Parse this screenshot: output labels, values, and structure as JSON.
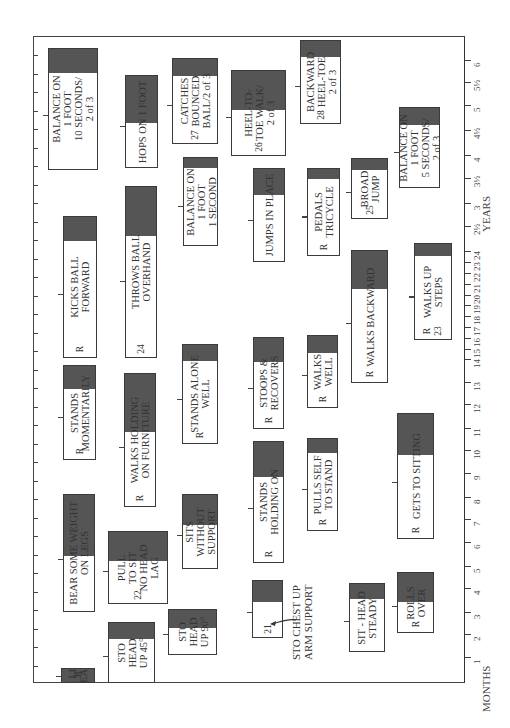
{
  "chart_data": {
    "type": "table",
    "orientation": "rotated 90deg counter-clockwise; age axis runs along right edge from bottom (1 month) to top (6 years)",
    "axes": {
      "months_label": "MONTHS",
      "years_label": "YEARS",
      "ticks": [
        "1",
        "2",
        "3",
        "4",
        "5",
        "6",
        "7",
        "8",
        "9",
        "10",
        "11",
        "12",
        "13",
        "14",
        "15",
        "16",
        "17",
        "18",
        "19",
        "20",
        "21",
        "22",
        "23",
        "24",
        "2½",
        "3",
        "3½",
        "4",
        "4½",
        "5",
        "5½",
        "6"
      ]
    },
    "milestones": [
      {
        "id": "balance10",
        "lines": [
          "BALANCE ON",
          "1 FOOT",
          "10 SECONDS/",
          "2 of 3"
        ],
        "prefix": "",
        "number": ""
      },
      {
        "id": "kicks",
        "lines": [
          "KICKS BALL",
          "FORWARD"
        ],
        "prefix": "R",
        "number": ""
      },
      {
        "id": "standsmom",
        "lines": [
          "STANDS",
          "MOMENTARILY"
        ],
        "prefix": "R",
        "number": ""
      },
      {
        "id": "bearweight",
        "lines": [
          "BEAR SOME WEIGHT",
          "ON LEGS"
        ],
        "prefix": "",
        "number": ""
      },
      {
        "id": "stolifts",
        "lines": [
          "STO LIFTS",
          "HEAD"
        ],
        "prefix": "R",
        "number": ""
      },
      {
        "id": "hops",
        "lines": [
          "HOPS ON 1 FOOT"
        ],
        "prefix": "",
        "number": ""
      },
      {
        "id": "throws",
        "lines": [
          "THROWS BALL",
          "OVERHAND"
        ],
        "prefix": "",
        "number": "24"
      },
      {
        "id": "walksholding",
        "lines": [
          "WALKS HOLDING",
          "ON FURNITURE"
        ],
        "prefix": "R",
        "number": ""
      },
      {
        "id": "pulltosit",
        "lines": [
          "PULL",
          "TO SIT",
          "NO HEAD",
          "LAG"
        ],
        "prefix": "",
        "number": "22"
      },
      {
        "id": "sto45",
        "lines": [
          "STO",
          "HEAD",
          "UP 45°"
        ],
        "prefix": "",
        "number": ""
      },
      {
        "id": "catches",
        "lines": [
          "CATCHES",
          "BOUNCED",
          "BALL/2 of 3"
        ],
        "prefix": "",
        "number": "27"
      },
      {
        "id": "balance1",
        "lines": [
          "BALANCE ON",
          "1 FOOT",
          "1 SECOND"
        ],
        "prefix": "",
        "number": ""
      },
      {
        "id": "standsalone",
        "lines": [
          "STANDS ALONE",
          "WELL"
        ],
        "prefix": "R",
        "number": ""
      },
      {
        "id": "sits",
        "lines": [
          "SITS",
          "WITHOUT",
          "SUPPORT"
        ],
        "prefix": "",
        "number": ""
      },
      {
        "id": "sto90",
        "lines": [
          "STO",
          "HEAD",
          "UP 90°"
        ],
        "prefix": "",
        "number": ""
      },
      {
        "id": "heeltoe",
        "lines": [
          "HEEL-TO-",
          "TOE WALK/",
          "2 of 3"
        ],
        "prefix": "",
        "number": "26"
      },
      {
        "id": "jumps",
        "lines": [
          "JUMPS IN PLACE"
        ],
        "prefix": "",
        "number": ""
      },
      {
        "id": "stoops",
        "lines": [
          "STOOPS &",
          "RECOVERS"
        ],
        "prefix": "R",
        "number": ""
      },
      {
        "id": "standsholding",
        "lines": [
          "STANDS",
          "HOLDING ON"
        ],
        "prefix": "R",
        "number": ""
      },
      {
        "id": "box21",
        "lines": [
          ""
        ],
        "prefix": "",
        "number": "21"
      },
      {
        "id": "backheeltoe",
        "lines": [
          "BACKWARD",
          "HEEL-TOE",
          "2 of 3"
        ],
        "prefix": "",
        "number": "28"
      },
      {
        "id": "pedals",
        "lines": [
          "PEDALS",
          "TRICYCLE"
        ],
        "prefix": "R",
        "number": ""
      },
      {
        "id": "walkswell",
        "lines": [
          "WALKS",
          "WELL"
        ],
        "prefix": "R",
        "number": ""
      },
      {
        "id": "pullsself",
        "lines": [
          "PULLS SELF",
          "TO STAND"
        ],
        "prefix": "R",
        "number": ""
      },
      {
        "id": "broadjump",
        "lines": [
          "BROAD",
          "JUMP"
        ],
        "prefix": "",
        "number": "25"
      },
      {
        "id": "walksback",
        "lines": [
          "WALKS BACKWARD"
        ],
        "prefix": "R",
        "number": ""
      },
      {
        "id": "getstosit",
        "lines": [
          "GETS TO SITTING"
        ],
        "prefix": "R",
        "number": ""
      },
      {
        "id": "sitsteady",
        "lines": [
          "SIT - HEAD",
          "STEADY"
        ],
        "prefix": "",
        "number": ""
      },
      {
        "id": "rolls",
        "lines": [
          "ROLLS",
          "OVER"
        ],
        "prefix": "R",
        "number": ""
      },
      {
        "id": "balance5",
        "lines": [
          "BALANCE ON",
          "1 FOOT",
          "5 SECONDS/",
          "2 of 3"
        ],
        "prefix": "",
        "number": ""
      },
      {
        "id": "walksup",
        "lines": [
          "WALKS UP",
          "STEPS"
        ],
        "prefix": "R",
        "number": "23"
      }
    ],
    "annotations": [
      {
        "text": "STO CHEST UP\nARM SUPPORT",
        "points_to": "box21"
      }
    ]
  },
  "labels": {
    "months": "MONTHS",
    "years": "YEARS",
    "sto_chest": "STO CHEST UP\nARM SUPPORT"
  }
}
